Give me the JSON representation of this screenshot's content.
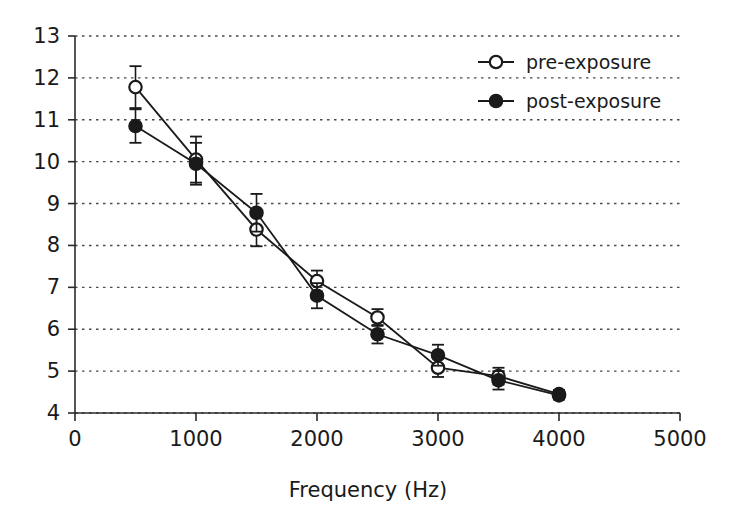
{
  "chart_data": {
    "type": "line",
    "title": "",
    "subtitle": "",
    "xlabel": "Frequency (Hz)",
    "ylabel": "",
    "xlim": [
      0,
      5000
    ],
    "ylim": [
      4,
      13
    ],
    "xticks": [
      0,
      1000,
      2000,
      3000,
      4000,
      5000
    ],
    "xtick_labels": [
      "0",
      "1000",
      "2000",
      "3000",
      "4000",
      "5000"
    ],
    "yticks": [
      4,
      5,
      6,
      7,
      8,
      9,
      10,
      11,
      12,
      13
    ],
    "ytick_labels": [
      "4",
      "5",
      "6",
      "7",
      "8",
      "9",
      "10",
      "11",
      "12",
      "13"
    ],
    "grid": "horizontal-dotted",
    "legend_position": "top-right",
    "x": [
      500,
      1000,
      1500,
      2000,
      2500,
      3000,
      3500,
      4000
    ],
    "series": [
      {
        "name": "pre-exposure",
        "marker": "open-circle",
        "color": "#1a1a1a",
        "values": [
          11.78,
          10.05,
          8.38,
          7.15,
          6.28,
          5.08,
          4.88,
          4.45
        ],
        "errors": [
          0.5,
          0.55,
          0.4,
          0.25,
          0.2,
          0.22,
          0.2,
          0.1
        ]
      },
      {
        "name": "post-exposure",
        "marker": "filled-circle",
        "color": "#1a1a1a",
        "values": [
          10.85,
          9.95,
          8.78,
          6.8,
          5.88,
          5.38,
          4.78,
          4.42
        ],
        "errors": [
          0.4,
          0.5,
          0.45,
          0.3,
          0.22,
          0.25,
          0.22,
          0.1
        ]
      }
    ]
  },
  "legend": {
    "items": [
      {
        "label": "pre-exposure",
        "marker": "open-circle"
      },
      {
        "label": "post-exposure",
        "marker": "filled-circle"
      }
    ]
  },
  "axes": {
    "x_title": "Frequency (Hz)"
  }
}
